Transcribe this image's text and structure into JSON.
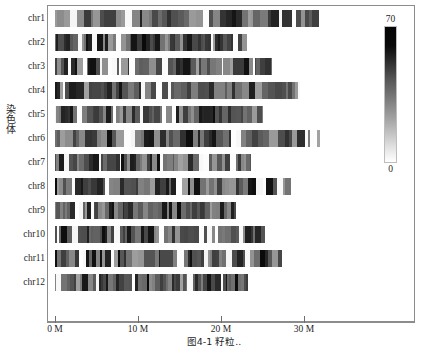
{
  "figure": {
    "y_axis_title": "染色体",
    "caption": "图4-1  籽粒.."
  },
  "colorbar": {
    "max_label": "70",
    "min_label": "0",
    "high_color": "#000000",
    "low_color": "#ffffff"
  },
  "chart_data": {
    "type": "heatmap",
    "title": "",
    "xlabel": "",
    "ylabel": "染色体",
    "xlim": [
      0,
      34.5
    ],
    "x_unit": "M",
    "grid": false,
    "legend": "colorbar-right",
    "colorbar": {
      "label": "",
      "vmin": 0,
      "vmax": 70,
      "colormap": "grayscale-inverted"
    },
    "x_tick_values": [
      0,
      10,
      20,
      30
    ],
    "x_tick_labels": [
      "0 M",
      "10 M",
      "20 M",
      "30 M"
    ],
    "categories": [
      "chr1",
      "chr2",
      "chr3",
      "chr4",
      "chr5",
      "chr6",
      "chr7",
      "chr8",
      "chr9",
      "chr10",
      "chr11",
      "chr12"
    ],
    "series": [
      {
        "name": "chromosome-length-Mb",
        "values": [
          31.8,
          23.1,
          26.2,
          29.5,
          25.1,
          31.9,
          23.6,
          28.4,
          21.8,
          25.3,
          27.4,
          23.3
        ]
      }
    ],
    "density_note": "Per-chromosome gene/marker density rendered as vertical grayscale stripes; darker = higher density (toward 70), lighter = lower density (toward 0)."
  },
  "rows": [
    {
      "label": "chr1",
      "length_mb": 31.8,
      "top": 10,
      "seed": 11
    },
    {
      "label": "chr2",
      "length_mb": 23.1,
      "top": 34,
      "seed": 27
    },
    {
      "label": "chr3",
      "length_mb": 26.2,
      "top": 58,
      "seed": 43
    },
    {
      "label": "chr4",
      "length_mb": 29.5,
      "top": 82,
      "seed": 59
    },
    {
      "label": "chr5",
      "length_mb": 25.1,
      "top": 106,
      "seed": 71
    },
    {
      "label": "chr6",
      "length_mb": 31.9,
      "top": 130,
      "seed": 89
    },
    {
      "label": "chr7",
      "length_mb": 23.6,
      "top": 154,
      "seed": 103
    },
    {
      "label": "chr8",
      "length_mb": 28.4,
      "top": 178,
      "seed": 127
    },
    {
      "label": "chr9",
      "length_mb": 21.8,
      "top": 202,
      "seed": 149
    },
    {
      "label": "chr10",
      "length_mb": 25.3,
      "top": 226,
      "seed": 167
    },
    {
      "label": "chr11",
      "length_mb": 27.4,
      "top": 250,
      "seed": 191
    },
    {
      "label": "chr12",
      "length_mb": 23.3,
      "top": 274,
      "seed": 211
    }
  ],
  "axis_geometry": {
    "origin_x_px": 55,
    "px_per_mb": 8.3,
    "bar_height_px": 17,
    "frame_left_px": 47,
    "frame_top_px": 5,
    "frame_width_px": 368,
    "frame_height_px": 317
  }
}
